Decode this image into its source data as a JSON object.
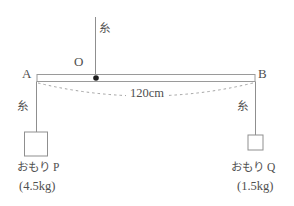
{
  "diagram": {
    "title_hint": "balance beam with hanging weights",
    "labels": {
      "point_o": "O",
      "point_a": "A",
      "point_b": "B",
      "string_top": "糸",
      "string_left": "糸",
      "string_right": "糸",
      "beam_length": "120cm",
      "weight_p_name": "おもり P",
      "weight_p_mass": "(4.5kg)",
      "weight_q_name": "おもり Q",
      "weight_q_mass": "(1.5kg)"
    },
    "colors": {
      "line": "#8f8f8f",
      "text": "#4f4f4f",
      "fulcrum_dot": "#1e1e1e",
      "background": "#ffffff"
    }
  }
}
